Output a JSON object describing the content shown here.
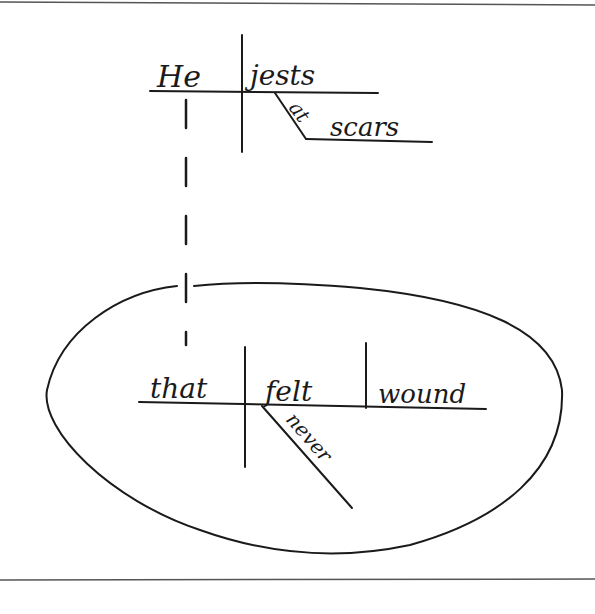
{
  "diagram": {
    "type": "sentence-diagram",
    "sentence": "He jests at scars that never felt a wound",
    "main_clause": {
      "subject": "He",
      "verb": "jests",
      "modifier_preposition": "at",
      "prepositional_object": "scars"
    },
    "relative_clause": {
      "subject": "that",
      "verb": "felt",
      "adverb": "never",
      "direct_object": "wound"
    },
    "connector": "dashed line from scars to that",
    "stroke_color": "#1a1a1a",
    "background_color": "#ffffff"
  }
}
